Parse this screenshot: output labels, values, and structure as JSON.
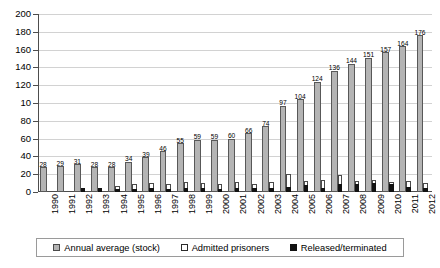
{
  "chart_data": {
    "type": "bar",
    "title": "",
    "xlabel": "",
    "ylabel": "",
    "ylim": [
      0,
      200
    ],
    "ytick_labels": [
      "200",
      "180",
      "160",
      "140",
      "120",
      "10",
      "80",
      "60",
      "40",
      "20",
      "0"
    ],
    "ytick_values": [
      200,
      180,
      160,
      140,
      120,
      100,
      80,
      60,
      40,
      20,
      0
    ],
    "grid": true,
    "legend_position": "bottom",
    "categories": [
      "1990",
      "1991",
      "1992",
      "1993",
      "1994",
      "1995",
      "1996",
      "1997",
      "1998",
      "1999",
      "2000",
      "2001",
      "2002",
      "2003",
      "2004",
      "2005",
      "2006",
      "2007",
      "2008",
      "2009",
      "2010",
      "2011",
      "2012"
    ],
    "series": [
      {
        "name": "Annual average (stock)",
        "color": "#b4b4b4",
        "values": [
          28,
          29,
          31,
          28,
          28,
          34,
          39,
          46,
          55,
          59,
          59,
          60,
          66,
          74,
          97,
          104,
          124,
          136,
          144,
          151,
          157,
          164,
          176
        ],
        "labels": [
          "28",
          "29",
          "31",
          "28",
          "28",
          "34",
          "39",
          "46",
          "55",
          "59",
          "59",
          "60",
          "66",
          "74",
          "97",
          "104",
          "124",
          "136",
          "144",
          "151",
          "157",
          "164",
          "176"
        ]
      },
      {
        "name": "Admitted prisoners",
        "color": "#ffffff",
        "values": [
          0,
          0,
          5,
          5,
          7,
          9,
          10,
          9,
          11,
          10,
          9,
          11,
          9,
          11,
          20,
          12,
          13,
          19,
          12,
          13,
          11,
          12,
          10
        ]
      },
      {
        "name": "Released/terminated",
        "color": "#121212",
        "values": [
          0,
          0,
          5,
          5,
          3,
          3,
          4,
          3,
          4,
          4,
          3,
          4,
          4,
          5,
          6,
          8,
          4,
          9,
          9,
          10,
          9,
          6,
          5
        ]
      }
    ]
  },
  "legend": {
    "entries": [
      {
        "label": "Annual average (stock)"
      },
      {
        "label": "Admitted prisoners"
      },
      {
        "label": "Released/terminated"
      }
    ]
  }
}
